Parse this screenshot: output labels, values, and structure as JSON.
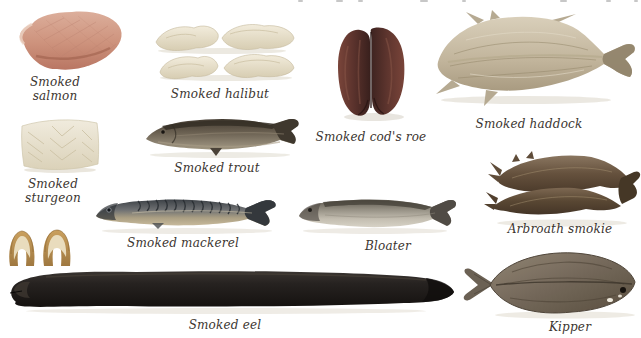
{
  "page": {
    "background": "#ffffff",
    "caption_color": "#3b3530"
  },
  "items": {
    "salmon": {
      "label": "Smoked salmon"
    },
    "halibut": {
      "label": "Smoked halibut"
    },
    "cods_roe": {
      "label": "Smoked cod's roe"
    },
    "haddock": {
      "label": "Smoked haddock"
    },
    "sturgeon": {
      "label": "Smoked sturgeon"
    },
    "trout": {
      "label": "Smoked trout"
    },
    "mackerel": {
      "label": "Smoked mackerel"
    },
    "bloater": {
      "label": "Bloater"
    },
    "arbroath_smokie": {
      "label": "Arbroath smokie"
    },
    "eel": {
      "label": "Smoked eel"
    },
    "kipper": {
      "label": "Kipper"
    }
  },
  "palette": {
    "salmon_flesh": "#cd927c",
    "halibut_flesh": "#e9e1cd",
    "cods_roe_skin": "#52302b",
    "haddock_flesh": "#c2b59e",
    "sturgeon_flesh": "#e9e3d2",
    "trout_skin": "#5d5447",
    "mackerel_back": "#3f4347",
    "mackerel_belly": "#c2b394",
    "bloater_silver": "#c6c0b4",
    "smokie_skin": "#5c4a38",
    "eel_skin": "#1d1916",
    "eel_piece_skin": "#b98f52",
    "kipper_skin": "#6e6253"
  }
}
